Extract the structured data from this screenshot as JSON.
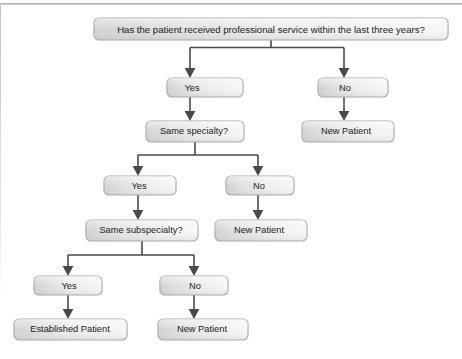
{
  "figure": {
    "type": "decision-flowchart",
    "title_visible": false,
    "background_color": "#ffffff",
    "node_fill_left": "#d4d4d4",
    "node_fill_right": "#f2f2f2",
    "node_border_color": "#a8a8a8",
    "connector_color": "#4a4a4a",
    "text_color": "#1c1c1c"
  },
  "nodes": [
    {
      "id": "q1",
      "label": "Has the patient received professional service within the last three years?",
      "x": 94,
      "y": 18,
      "w": 354,
      "h": 22,
      "role": "question"
    },
    {
      "id": "q1-yes",
      "label": "Yes",
      "x": 167,
      "y": 78,
      "w": 76,
      "h": 19,
      "role": "answer"
    },
    {
      "id": "q1-no",
      "label": "No",
      "x": 318,
      "y": 78,
      "w": 70,
      "h": 19,
      "role": "answer"
    },
    {
      "id": "out-new-1",
      "label": "New Patient",
      "x": 302,
      "y": 121,
      "w": 92,
      "h": 21,
      "role": "outcome"
    },
    {
      "id": "q2",
      "label": "Same specialty?",
      "x": 146,
      "y": 121,
      "w": 98,
      "h": 21,
      "role": "question"
    },
    {
      "id": "q2-yes",
      "label": "Yes",
      "x": 104,
      "y": 176,
      "w": 72,
      "h": 19,
      "role": "answer"
    },
    {
      "id": "q2-no",
      "label": "No",
      "x": 226,
      "y": 176,
      "w": 68,
      "h": 19,
      "role": "answer"
    },
    {
      "id": "out-new-2",
      "label": "New Patient",
      "x": 215,
      "y": 220,
      "w": 92,
      "h": 21,
      "role": "outcome"
    },
    {
      "id": "q3",
      "label": "Same subspecialty?",
      "x": 86,
      "y": 220,
      "w": 112,
      "h": 21,
      "role": "question"
    },
    {
      "id": "q3-yes",
      "label": "Yes",
      "x": 34,
      "y": 276,
      "w": 68,
      "h": 19,
      "role": "answer"
    },
    {
      "id": "q3-no",
      "label": "No",
      "x": 160,
      "y": 276,
      "w": 68,
      "h": 19,
      "role": "answer"
    },
    {
      "id": "out-established",
      "label": "Established Patient",
      "x": 14,
      "y": 319,
      "w": 113,
      "h": 21,
      "role": "outcome"
    },
    {
      "id": "out-new-3",
      "label": "New Patient",
      "x": 158,
      "y": 319,
      "w": 90,
      "h": 21,
      "role": "outcome"
    }
  ],
  "edges": [
    {
      "from": "q1",
      "to": "q1-yes",
      "label": ""
    },
    {
      "from": "q1",
      "to": "q1-no",
      "label": ""
    },
    {
      "from": "q1-yes",
      "to": "q2",
      "label": ""
    },
    {
      "from": "q1-no",
      "to": "out-new-1",
      "label": ""
    },
    {
      "from": "q2",
      "to": "q2-yes",
      "label": ""
    },
    {
      "from": "q2",
      "to": "q2-no",
      "label": ""
    },
    {
      "from": "q2-yes",
      "to": "q3",
      "label": ""
    },
    {
      "from": "q2-no",
      "to": "out-new-2",
      "label": ""
    },
    {
      "from": "q3",
      "to": "q3-yes",
      "label": ""
    },
    {
      "from": "q3",
      "to": "q3-no",
      "label": ""
    },
    {
      "from": "q3-yes",
      "to": "out-established",
      "label": ""
    },
    {
      "from": "q3-no",
      "to": "out-new-3",
      "label": ""
    }
  ]
}
